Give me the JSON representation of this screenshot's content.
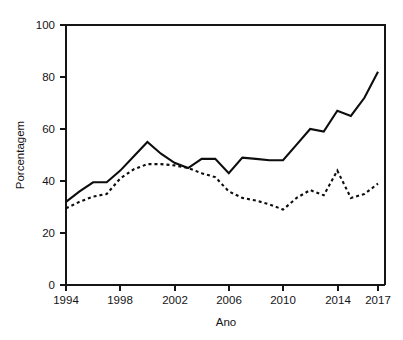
{
  "figure": {
    "background_color": "#ffffff",
    "ink_color": "#0d0d0d"
  },
  "axis": {
    "y_title": "Porcentagem",
    "x_title": "Ano",
    "y_ticks": [
      "0",
      "20",
      "40",
      "60",
      "80",
      "100"
    ],
    "x_ticks": [
      "1994",
      "1998",
      "2002",
      "2006",
      "2010",
      "2014",
      "2017"
    ]
  },
  "chart_data": {
    "type": "line",
    "title": "",
    "subtitle": "",
    "xlabel": "Ano",
    "ylabel": "Porcentagem",
    "xlim": [
      1994,
      2017
    ],
    "ylim": [
      0,
      100
    ],
    "xticks": [
      1994,
      1998,
      2002,
      2006,
      2010,
      2014,
      2017
    ],
    "yticks": [
      0,
      20,
      40,
      60,
      80,
      100
    ],
    "grid": false,
    "legend": null,
    "legend_position": "none",
    "x": [
      1994,
      1995,
      1996,
      1997,
      1998,
      1999,
      2000,
      2001,
      2002,
      2003,
      2004,
      2005,
      2006,
      2007,
      2008,
      2009,
      2010,
      2011,
      2012,
      2013,
      2014,
      2015,
      2016,
      2017
    ],
    "series": [
      {
        "name": "serie-continua",
        "style": "solid",
        "values": [
          32,
          36,
          39.5,
          39.5,
          44,
          49.5,
          55,
          50.5,
          47,
          45,
          48.5,
          48.5,
          43,
          49,
          48.5,
          48,
          48,
          54,
          60,
          59,
          67,
          65,
          72,
          82
        ]
      },
      {
        "name": "serie-tracejada",
        "style": "dotted",
        "values": [
          29.5,
          32,
          34,
          35,
          41,
          44.5,
          46.5,
          46.5,
          46,
          45,
          43,
          41.5,
          36,
          33.5,
          32.5,
          31,
          29,
          33.5,
          36.5,
          34.5,
          44,
          33.5,
          35,
          39
        ]
      }
    ]
  }
}
